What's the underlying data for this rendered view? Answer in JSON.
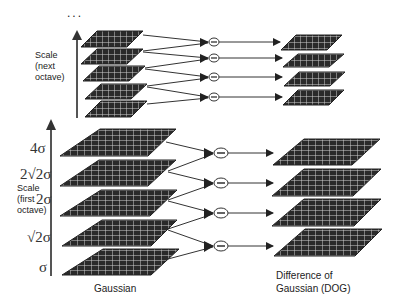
{
  "diagram": {
    "type": "scale-space pyramid / Difference of Gaussian",
    "top_dots": "...",
    "upper_axis_label": [
      "Scale",
      "(next",
      "octave)"
    ],
    "lower_axis_label": [
      "Scale",
      "(first",
      "octave)"
    ],
    "sigma_ticks": [
      "4σ",
      "2√2σ",
      "2σ",
      "√2σ",
      "σ"
    ],
    "gaussian_caption": "Gaussian",
    "dog_caption": [
      "Difference of",
      "Gaussian (DOG)"
    ],
    "minus_symbol": "−",
    "upper_octave": {
      "gaussian_levels": 5,
      "dog_levels": 4
    },
    "lower_octave": {
      "gaussian_levels": 5,
      "dog_levels": 4
    },
    "colors": {
      "plane_fill": "#2a2a2a",
      "grid": "#d8d8d8",
      "line": "#333333"
    }
  }
}
